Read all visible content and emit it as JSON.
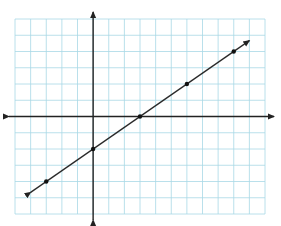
{
  "chart_data": {
    "type": "line",
    "title": "",
    "xlabel": "",
    "ylabel": "",
    "grid": true,
    "xlim": [
      -5,
      11
    ],
    "ylim": [
      -6,
      6
    ],
    "grid_step": 1,
    "equation": "y = (2/3)x - 2",
    "slope": 0.6667,
    "y_intercept": -2,
    "x_intercept": 3,
    "series": [
      {
        "name": "line",
        "points": [
          {
            "x": -3,
            "y": -4
          },
          {
            "x": 0,
            "y": -2
          },
          {
            "x": 3,
            "y": 0
          },
          {
            "x": 6,
            "y": 2
          },
          {
            "x": 9,
            "y": 4
          }
        ],
        "arrow_ends": [
          {
            "x": -4,
            "y": -4.67
          },
          {
            "x": 10,
            "y": 4.67
          }
        ]
      }
    ],
    "legend": []
  },
  "colors": {
    "grid": "#a8d8e6",
    "axes": "#222222",
    "line": "#2a2a2a",
    "points": "#111111",
    "background": "#ffffff"
  }
}
